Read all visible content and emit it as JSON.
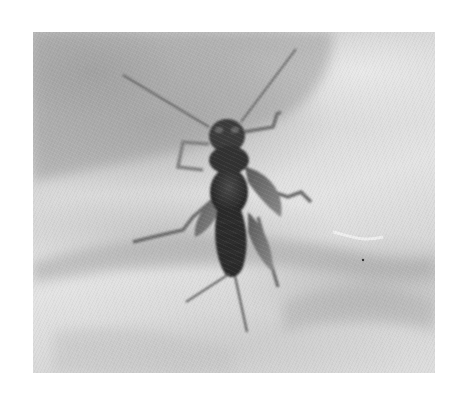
{
  "image": {
    "subject": "stonefly nymph on a human palm",
    "style": "grayscale photograph",
    "colors": {
      "border": "#ffffff",
      "skin_light": "#e4e4e4",
      "skin_shadow": "#a8a8a8",
      "insect_body": "#2e2e2e",
      "insect_legs": "#6a6a6a"
    }
  }
}
